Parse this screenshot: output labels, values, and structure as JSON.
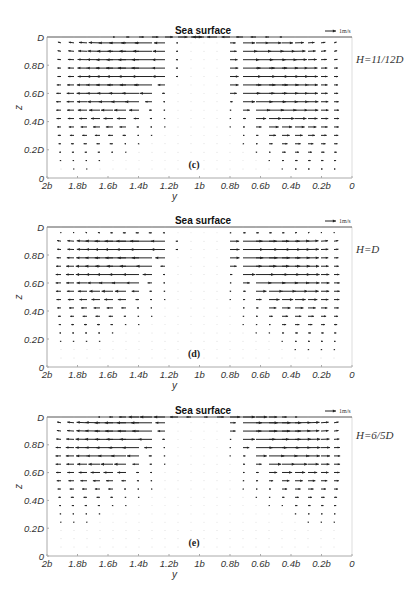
{
  "chart_data": [
    {
      "type": "quiver",
      "panel_label": "(c)",
      "title": "Sea surface",
      "condition": "H=11/12D",
      "xlabel": "y",
      "ylabel": "z",
      "xticks": [
        "2b",
        "1.8b",
        "1.6b",
        "1.4b",
        "1.2b",
        "1b",
        "0.8b",
        "0.6b",
        "0.4b",
        "0.2b",
        "0"
      ],
      "yticks": [
        "0",
        "0.2D",
        "0.4D",
        "0.6D",
        "0.8D",
        "D"
      ],
      "xlim": [
        "2b",
        "0"
      ],
      "ylim": [
        "0",
        "D"
      ],
      "scale_arrow": "1m/s",
      "description": "Two counter-rotating cells: left half flows toward -y (leftward) strongest near 1.4b-1.2b at 0.6D-0.9D; right half flows toward +y (rightward) strongest near 0.8b-0.4b at 0.5D-0.9D; weak/near-zero band around 1b below ~0.9D; surface row shows converging flow at y=1b.",
      "pixel_frame": {
        "top": 37,
        "bottom": 178
      },
      "field": {
        "left_peak_z": 0.72,
        "right_peak_z": 0.62,
        "peak_len": 22,
        "gap_halfwidth": 0.12,
        "surface_row": true
      }
    },
    {
      "type": "quiver",
      "panel_label": "(d)",
      "title": "Sea surface",
      "condition": "H=D",
      "xlabel": "y",
      "ylabel": "z",
      "xticks": [
        "2b",
        "1.8b",
        "1.6b",
        "1.4b",
        "1.2b",
        "1b",
        "0.8b",
        "0.6b",
        "0.4b",
        "0.2b",
        "0"
      ],
      "yticks": [
        "0",
        "0.2D",
        "0.4D",
        "0.6D",
        "0.8D",
        "D"
      ],
      "xlim": [
        "2b",
        "0"
      ],
      "ylim": [
        "0",
        "D"
      ],
      "scale_arrow": "1m/s",
      "description": "Similar two-cell structure; strongest leftward flow near 1.3b-1.2b at 0.8D-0.95D, strongest rightward flow near 0.8b-0.5b at 0.7D-0.95D; surface row nearly still.",
      "pixel_frame": {
        "top": 227,
        "bottom": 367
      },
      "field": {
        "left_peak_z": 0.82,
        "right_peak_z": 0.75,
        "peak_len": 22,
        "gap_halfwidth": 0.12,
        "surface_row": false
      }
    },
    {
      "type": "quiver",
      "panel_label": "(e)",
      "title": "Sea surface",
      "condition": "H=6/5D",
      "xlabel": "y",
      "ylabel": "z",
      "xticks": [
        "2b",
        "1.8b",
        "1.6b",
        "1.4b",
        "1.2b",
        "1b",
        "0.8b",
        "0.6b",
        "0.4b",
        "0.2b",
        "0"
      ],
      "yticks": [
        "0",
        "0.2D",
        "0.4D",
        "0.6D",
        "0.8D",
        "D"
      ],
      "xlim": [
        "2b",
        "0"
      ],
      "ylim": [
        "0",
        "D"
      ],
      "scale_arrow": "1m/s",
      "description": "Two-cell structure with maximum flow close to the surface; leftward arrows strongest near 1.3b at 0.95D-D, rightward arrows strongest near 0.7b at 0.9D-D; wide quiet band around 1b.",
      "pixel_frame": {
        "top": 417,
        "bottom": 556
      },
      "field": {
        "left_peak_z": 0.92,
        "right_peak_z": 0.9,
        "peak_len": 20,
        "gap_halfwidth": 0.15,
        "surface_row": true
      }
    }
  ],
  "layout": {
    "frame_left": 47,
    "frame_right": 352,
    "colors": {
      "arrow": "#222222",
      "axis": "#aaaaaa",
      "text": "#333333"
    }
  }
}
